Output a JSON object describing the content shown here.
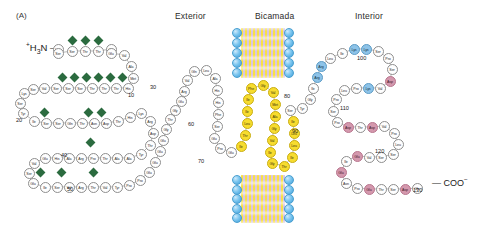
{
  "figure": {
    "panel_label": "(A)",
    "n_terminus": "+H3N",
    "c_terminus": "COO-",
    "background_color": "#ffffff"
  },
  "headers": [
    {
      "label": "Exterior",
      "x": 175,
      "y": 11
    },
    {
      "label": "Bicamada",
      "x": 255,
      "y": 11
    },
    {
      "label": "Interior",
      "x": 355,
      "y": 11
    }
  ],
  "legend_colors": {
    "neutral_residue": "#fefefe",
    "hydrophobic_residue": "#f7dc2e",
    "basic_residue": "#8dc3e8",
    "acidic_residue": "#d498ad",
    "glycosylation_marker": "#2b6b3f",
    "lipid_head": "#3f9ed8",
    "lipid_tail": "#f7df3c"
  },
  "bilayers": [
    {
      "name": "upper-bilayer",
      "x": 232,
      "y": 28,
      "width": 62,
      "height": 50
    },
    {
      "name": "lower-bilayer",
      "x": 232,
      "y": 175,
      "width": 62,
      "height": 48
    }
  ],
  "residue_numbers": [
    {
      "value": "10",
      "x": 133,
      "y": 92
    },
    {
      "value": "20",
      "x": 21,
      "y": 117
    },
    {
      "value": "30",
      "x": 155,
      "y": 84
    },
    {
      "value": "40",
      "x": 66,
      "y": 152
    },
    {
      "value": "50",
      "x": 72,
      "y": 186
    },
    {
      "value": "60",
      "x": 193,
      "y": 121
    },
    {
      "value": "70",
      "x": 203,
      "y": 158
    },
    {
      "value": "80",
      "x": 289,
      "y": 93
    },
    {
      "value": "90",
      "x": 297,
      "y": 128
    },
    {
      "value": "100",
      "x": 362,
      "y": 55
    },
    {
      "value": "110",
      "x": 345,
      "y": 105
    },
    {
      "value": "120",
      "x": 380,
      "y": 148
    },
    {
      "value": "130",
      "x": 418,
      "y": 187
    }
  ],
  "glycosylation_sites": [
    {
      "x": 72,
      "y": 40
    },
    {
      "x": 85,
      "y": 40
    },
    {
      "x": 98,
      "y": 40
    },
    {
      "x": 62,
      "y": 77
    },
    {
      "x": 74,
      "y": 77
    },
    {
      "x": 86,
      "y": 77
    },
    {
      "x": 98,
      "y": 77
    },
    {
      "x": 110,
      "y": 77
    },
    {
      "x": 122,
      "y": 77
    },
    {
      "x": 44,
      "y": 112
    },
    {
      "x": 88,
      "y": 112
    },
    {
      "x": 101,
      "y": 112
    },
    {
      "x": 90,
      "y": 142
    },
    {
      "x": 40,
      "y": 172
    },
    {
      "x": 61,
      "y": 172
    },
    {
      "x": 93,
      "y": 172
    }
  ],
  "residues": [
    {
      "t": "Leu",
      "x": 58,
      "y": 49,
      "c": "n"
    },
    {
      "t": "Ser",
      "x": 58,
      "y": 53,
      "c": "n"
    },
    {
      "t": "Ser",
      "x": 72,
      "y": 51,
      "c": "n"
    },
    {
      "t": "Thr",
      "x": 85,
      "y": 51,
      "c": "n"
    },
    {
      "t": "Thr",
      "x": 98,
      "y": 51,
      "c": "n"
    },
    {
      "t": "Gly",
      "x": 111,
      "y": 49,
      "c": "n"
    },
    {
      "t": "Glu",
      "x": 111,
      "y": 53,
      "c": "n"
    },
    {
      "t": "Val",
      "x": 124,
      "y": 55,
      "c": "n"
    },
    {
      "t": "Ala",
      "x": 131,
      "y": 66,
      "c": "n"
    },
    {
      "t": "Met",
      "x": 133,
      "y": 78,
      "c": "n"
    },
    {
      "t": "His",
      "x": 128,
      "y": 88,
      "c": "n"
    },
    {
      "t": "Thr",
      "x": 116,
      "y": 88,
      "c": "n"
    },
    {
      "t": "Thr",
      "x": 104,
      "y": 88,
      "c": "n"
    },
    {
      "t": "Thr",
      "x": 92,
      "y": 88,
      "c": "n"
    },
    {
      "t": "Ser",
      "x": 80,
      "y": 88,
      "c": "n"
    },
    {
      "t": "Ser",
      "x": 68,
      "y": 88,
      "c": "n"
    },
    {
      "t": "Ser",
      "x": 56,
      "y": 88,
      "c": "n"
    },
    {
      "t": "Val",
      "x": 44,
      "y": 88,
      "c": "n"
    },
    {
      "t": "Ser",
      "x": 33,
      "y": 89,
      "c": "n"
    },
    {
      "t": "Lys",
      "x": 24,
      "y": 93,
      "c": "n"
    },
    {
      "t": "Ser",
      "x": 20,
      "y": 103,
      "c": "n"
    },
    {
      "t": "Tyr",
      "x": 23,
      "y": 113,
      "c": "n"
    },
    {
      "t": "Ile",
      "x": 34,
      "y": 121,
      "c": "n"
    },
    {
      "t": "Ser",
      "x": 46,
      "y": 123,
      "c": "n"
    },
    {
      "t": "Ser",
      "x": 58,
      "y": 123,
      "c": "n"
    },
    {
      "t": "Gln",
      "x": 70,
      "y": 123,
      "c": "n"
    },
    {
      "t": "Thr",
      "x": 82,
      "y": 123,
      "c": "n"
    },
    {
      "t": "Asn",
      "x": 94,
      "y": 123,
      "c": "n"
    },
    {
      "t": "Asp",
      "x": 106,
      "y": 123,
      "c": "n"
    },
    {
      "t": "Thr",
      "x": 118,
      "y": 121,
      "c": "n"
    },
    {
      "t": "His",
      "x": 130,
      "y": 117,
      "c": "n"
    },
    {
      "t": "Lys",
      "x": 141,
      "y": 113,
      "c": "n"
    },
    {
      "t": "Arg",
      "x": 150,
      "y": 121,
      "c": "n"
    },
    {
      "t": "Asp",
      "x": 153,
      "y": 133,
      "c": "n"
    },
    {
      "t": "Thr",
      "x": 150,
      "y": 145,
      "c": "n"
    },
    {
      "t": "Tyr",
      "x": 141,
      "y": 154,
      "c": "n"
    },
    {
      "t": "Ala",
      "x": 129,
      "y": 158,
      "c": "n"
    },
    {
      "t": "Ala",
      "x": 117,
      "y": 158,
      "c": "n"
    },
    {
      "t": "Thr",
      "x": 105,
      "y": 158,
      "c": "n"
    },
    {
      "t": "Pro",
      "x": 93,
      "y": 158,
      "c": "n"
    },
    {
      "t": "Arg",
      "x": 81,
      "y": 158,
      "c": "n"
    },
    {
      "t": "Ala",
      "x": 69,
      "y": 158,
      "c": "n"
    },
    {
      "t": "His",
      "x": 57,
      "y": 158,
      "c": "n"
    },
    {
      "t": "Glu",
      "x": 45,
      "y": 158,
      "c": "n"
    },
    {
      "t": "Val",
      "x": 34,
      "y": 163,
      "c": "n"
    },
    {
      "t": "Ser",
      "x": 29,
      "y": 173,
      "c": "n"
    },
    {
      "t": "Glu",
      "x": 33,
      "y": 183,
      "c": "n"
    },
    {
      "t": "Ile",
      "x": 45,
      "y": 187,
      "c": "n"
    },
    {
      "t": "Ser",
      "x": 57,
      "y": 187,
      "c": "n"
    },
    {
      "t": "Val",
      "x": 69,
      "y": 187,
      "c": "n"
    },
    {
      "t": "Arg",
      "x": 81,
      "y": 187,
      "c": "n"
    },
    {
      "t": "Thr",
      "x": 93,
      "y": 187,
      "c": "n"
    },
    {
      "t": "Val",
      "x": 105,
      "y": 187,
      "c": "n"
    },
    {
      "t": "Tyr",
      "x": 117,
      "y": 187,
      "c": "n"
    },
    {
      "t": "Pro",
      "x": 129,
      "y": 185,
      "c": "n"
    },
    {
      "t": "Pro",
      "x": 140,
      "y": 180,
      "c": "n"
    },
    {
      "t": "Glu",
      "x": 149,
      "y": 172,
      "c": "n"
    },
    {
      "t": "Glu",
      "x": 155,
      "y": 162,
      "c": "n"
    },
    {
      "t": "Glu",
      "x": 160,
      "y": 151,
      "c": "n"
    },
    {
      "t": "Glu",
      "x": 163,
      "y": 140,
      "c": "n"
    },
    {
      "t": "Gly",
      "x": 166,
      "y": 129,
      "c": "n"
    },
    {
      "t": "Thr",
      "x": 170,
      "y": 119,
      "c": "n"
    },
    {
      "t": "Gly",
      "x": 175,
      "y": 110,
      "c": "n"
    },
    {
      "t": "Glu",
      "x": 181,
      "y": 101,
      "c": "n"
    },
    {
      "t": "Arg",
      "x": 184,
      "y": 91,
      "c": "n"
    },
    {
      "t": "Val",
      "x": 187,
      "y": 80,
      "c": "n"
    },
    {
      "t": "Gln",
      "x": 194,
      "y": 71,
      "c": "n"
    },
    {
      "t": "Leu",
      "x": 206,
      "y": 70,
      "c": "n"
    },
    {
      "t": "Ala",
      "x": 215,
      "y": 78,
      "c": "n"
    },
    {
      "t": "His",
      "x": 217,
      "y": 90,
      "c": "n"
    },
    {
      "t": "His",
      "x": 218,
      "y": 102,
      "c": "n"
    },
    {
      "t": "Phe",
      "x": 218,
      "y": 114,
      "c": "n"
    },
    {
      "t": "Ser",
      "x": 217,
      "y": 126,
      "c": "n"
    },
    {
      "t": "Glu",
      "x": 214,
      "y": 138,
      "c": "n"
    },
    {
      "t": "Pro",
      "x": 220,
      "y": 148,
      "c": "n"
    },
    {
      "t": "Glu",
      "x": 231,
      "y": 152,
      "c": "n"
    },
    {
      "t": "Ile",
      "x": 241,
      "y": 146,
      "c": "h"
    },
    {
      "t": "Thr",
      "x": 245,
      "y": 135,
      "c": "h"
    },
    {
      "t": "Leu",
      "x": 247,
      "y": 123,
      "c": "h"
    },
    {
      "t": "Ile",
      "x": 247,
      "y": 111,
      "c": "h"
    },
    {
      "t": "Ile",
      "x": 248,
      "y": 99,
      "c": "h"
    },
    {
      "t": "Phe",
      "x": 251,
      "y": 88,
      "c": "h"
    },
    {
      "t": "Gly",
      "x": 263,
      "y": 85,
      "c": "h"
    },
    {
      "t": "Val",
      "x": 273,
      "y": 92,
      "c": "h"
    },
    {
      "t": "Met",
      "x": 275,
      "y": 104,
      "c": "h"
    },
    {
      "t": "Ala",
      "x": 275,
      "y": 116,
      "c": "h"
    },
    {
      "t": "Gly",
      "x": 274,
      "y": 128,
      "c": "h"
    },
    {
      "t": "Val",
      "x": 272,
      "y": 140,
      "c": "h"
    },
    {
      "t": "Ile",
      "x": 270,
      "y": 152,
      "c": "h"
    },
    {
      "t": "Gly",
      "x": 272,
      "y": 163,
      "c": "h"
    },
    {
      "t": "Thr",
      "x": 284,
      "y": 166,
      "c": "h"
    },
    {
      "t": "Ile",
      "x": 292,
      "y": 157,
      "c": "h"
    },
    {
      "t": "Leu",
      "x": 294,
      "y": 145,
      "c": "h"
    },
    {
      "t": "Leu",
      "x": 294,
      "y": 133,
      "c": "h"
    },
    {
      "t": "Ile",
      "x": 293,
      "y": 121,
      "c": "h"
    },
    {
      "t": "Ser",
      "x": 290,
      "y": 110,
      "c": "n"
    },
    {
      "t": "Tyr",
      "x": 302,
      "y": 108,
      "c": "n"
    },
    {
      "t": "Gly",
      "x": 310,
      "y": 99,
      "c": "n"
    },
    {
      "t": "Ile",
      "x": 313,
      "y": 88,
      "c": "n"
    },
    {
      "t": "Arg",
      "x": 317,
      "y": 77,
      "c": "b"
    },
    {
      "t": "Arg",
      "x": 321,
      "y": 66,
      "c": "b"
    },
    {
      "t": "Leu",
      "x": 330,
      "y": 58,
      "c": "n"
    },
    {
      "t": "Ile",
      "x": 342,
      "y": 53,
      "c": "n"
    },
    {
      "t": "Lys",
      "x": 354,
      "y": 49,
      "c": "b"
    },
    {
      "t": "Lys",
      "x": 366,
      "y": 49,
      "c": "b"
    },
    {
      "t": "Ser",
      "x": 378,
      "y": 51,
      "c": "n"
    },
    {
      "t": "Pro",
      "x": 388,
      "y": 58,
      "c": "n"
    },
    {
      "t": "Ser",
      "x": 392,
      "y": 69,
      "c": "n"
    },
    {
      "t": "Asp",
      "x": 390,
      "y": 81,
      "c": "a"
    },
    {
      "t": "Val",
      "x": 380,
      "y": 88,
      "c": "n"
    },
    {
      "t": "Lys",
      "x": 368,
      "y": 88,
      "c": "b"
    },
    {
      "t": "Pro",
      "x": 356,
      "y": 88,
      "c": "n"
    },
    {
      "t": "Leu",
      "x": 344,
      "y": 90,
      "c": "n"
    },
    {
      "t": "Pro",
      "x": 336,
      "y": 99,
      "c": "n"
    },
    {
      "t": "Ser",
      "x": 333,
      "y": 111,
      "c": "n"
    },
    {
      "t": "Pro",
      "x": 337,
      "y": 122,
      "c": "n"
    },
    {
      "t": "Asp",
      "x": 348,
      "y": 127,
      "c": "a"
    },
    {
      "t": "Thr",
      "x": 360,
      "y": 127,
      "c": "n"
    },
    {
      "t": "Asp",
      "x": 372,
      "y": 127,
      "c": "a"
    },
    {
      "t": "Val",
      "x": 384,
      "y": 126,
      "c": "n"
    },
    {
      "t": "Pro",
      "x": 394,
      "y": 133,
      "c": "n"
    },
    {
      "t": "Leu",
      "x": 398,
      "y": 144,
      "c": "n"
    },
    {
      "t": "Ser",
      "x": 393,
      "y": 154,
      "c": "n"
    },
    {
      "t": "Ser",
      "x": 381,
      "y": 157,
      "c": "n"
    },
    {
      "t": "Val",
      "x": 369,
      "y": 157,
      "c": "n"
    },
    {
      "t": "Glu",
      "x": 357,
      "y": 156,
      "c": "a"
    },
    {
      "t": "Ile",
      "x": 346,
      "y": 161,
      "c": "n"
    },
    {
      "t": "Glu",
      "x": 341,
      "y": 172,
      "c": "a"
    },
    {
      "t": "Asn",
      "x": 346,
      "y": 183,
      "c": "n"
    },
    {
      "t": "Pro",
      "x": 357,
      "y": 188,
      "c": "n"
    },
    {
      "t": "Glu",
      "x": 369,
      "y": 189,
      "c": "a"
    },
    {
      "t": "Thr",
      "x": 381,
      "y": 189,
      "c": "n"
    },
    {
      "t": "Ser",
      "x": 393,
      "y": 189,
      "c": "n"
    },
    {
      "t": "Asp",
      "x": 405,
      "y": 189,
      "c": "a"
    },
    {
      "t": "Gln",
      "x": 417,
      "y": 188,
      "c": "n"
    }
  ]
}
